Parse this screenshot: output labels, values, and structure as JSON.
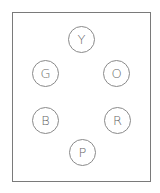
{
  "diagram": {
    "nodes": [
      {
        "id": "Y",
        "label": "Y",
        "cx": 81,
        "cy": 39
      },
      {
        "id": "G",
        "label": "G",
        "cx": 45,
        "cy": 73
      },
      {
        "id": "O",
        "label": "O",
        "cx": 116,
        "cy": 73
      },
      {
        "id": "B",
        "label": "B",
        "cx": 45,
        "cy": 120
      },
      {
        "id": "R",
        "label": "R",
        "cx": 117,
        "cy": 120
      },
      {
        "id": "P",
        "label": "P",
        "cx": 82,
        "cy": 152
      }
    ],
    "colors": {
      "stroke": "#8a8a8a",
      "text": "#666666",
      "background": "#ffffff"
    }
  }
}
